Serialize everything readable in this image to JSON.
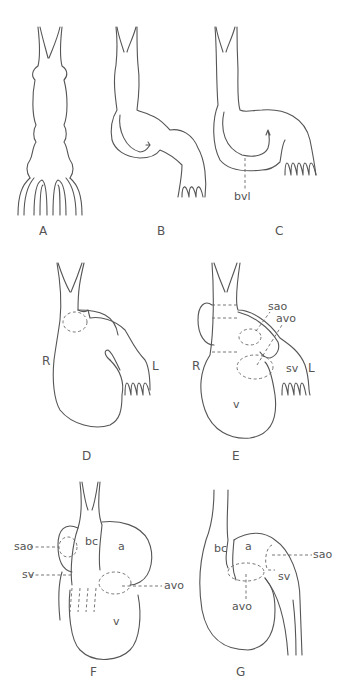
{
  "figure": {
    "panels": [
      {
        "id": "A",
        "label": "A"
      },
      {
        "id": "B",
        "label": "B"
      },
      {
        "id": "C",
        "label": "C",
        "annotations": [
          "bvl"
        ]
      },
      {
        "id": "D",
        "label": "D",
        "annotations": [
          "R",
          "L"
        ]
      },
      {
        "id": "E",
        "label": "E",
        "annotations": [
          "sao",
          "avo",
          "R",
          "L",
          "sv",
          "v"
        ]
      },
      {
        "id": "F",
        "label": "F",
        "annotations": [
          "bc",
          "a",
          "sao",
          "sv",
          "avo",
          "v"
        ]
      },
      {
        "id": "G",
        "label": "G",
        "annotations": [
          "bc",
          "a",
          "sao",
          "sv",
          "avo"
        ]
      }
    ],
    "labels": {
      "A": "A",
      "B": "B",
      "C": "C",
      "D": "D",
      "E": "E",
      "F": "F",
      "G": "G",
      "bvl": "bvl",
      "R": "R",
      "L": "L",
      "sao": "sao",
      "avo": "avo",
      "sv": "sv",
      "v": "v",
      "bc": "bc",
      "a": "a"
    }
  }
}
